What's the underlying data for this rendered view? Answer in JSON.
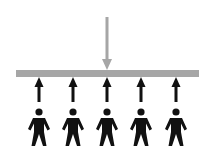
{
  "diagram": {
    "type": "load-support",
    "colors": {
      "background": "#ffffff",
      "beam": "#a6a6a6",
      "load_arrow": "#a6a6a6",
      "support_arrow": "#111111",
      "person": "#111111"
    },
    "beam": {
      "x1": 16,
      "x2": 199,
      "y": 70,
      "height": 7
    },
    "load_arrow": {
      "x": 107,
      "y_start": 17,
      "y_end": 70,
      "direction": "down"
    },
    "people": [
      {
        "id": 1,
        "x": 39
      },
      {
        "id": 2,
        "x": 73
      },
      {
        "id": 3,
        "x": 107
      },
      {
        "id": 4,
        "x": 141
      },
      {
        "id": 5,
        "x": 176
      }
    ],
    "support_arrows": {
      "direction": "up",
      "y_start": 102,
      "y_end": 77
    }
  }
}
